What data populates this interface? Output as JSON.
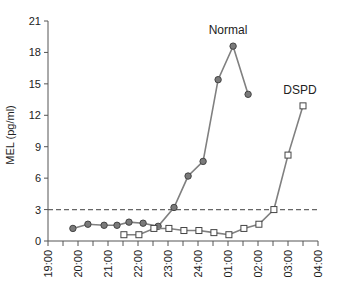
{
  "chart_data": {
    "type": "line",
    "title": "",
    "xlabel": "",
    "ylabel": "MEL (pg/ml)",
    "ylim": [
      0,
      21
    ],
    "yticks": [
      0,
      3,
      6,
      9,
      12,
      15,
      18,
      21
    ],
    "xlim_hours": [
      19,
      28
    ],
    "xticks": [
      "19:00",
      "20:00",
      "21:00",
      "22:00",
      "23:00",
      "24:00",
      "01:00",
      "02:00",
      "03:00",
      "04:00"
    ],
    "minor_tick_interval_minutes": 30,
    "grid": false,
    "reference_line": {
      "y": 3,
      "style": "dashed",
      "label": ""
    },
    "series": [
      {
        "name": "Normal",
        "marker": "circle-filled",
        "x": [
          "19:50",
          "20:20",
          "20:52",
          "21:18",
          "21:42",
          "22:10",
          "22:40",
          "23:12",
          "23:40",
          "24:10",
          "24:40",
          "01:10",
          "01:40"
        ],
        "x_hours": [
          19.83,
          20.33,
          20.87,
          21.3,
          21.7,
          22.17,
          22.67,
          23.2,
          23.67,
          24.17,
          24.67,
          25.17,
          25.67
        ],
        "values": [
          1.2,
          1.6,
          1.5,
          1.5,
          1.8,
          1.7,
          1.4,
          3.2,
          6.2,
          7.6,
          15.4,
          18.6,
          14.0
        ],
        "label_position": {
          "x_hours": 25.0,
          "y": 19.8
        }
      },
      {
        "name": "DSPD",
        "marker": "square-open",
        "x": [
          "21:32",
          "22:02",
          "22:32",
          "23:02",
          "23:32",
          "24:02",
          "24:32",
          "01:02",
          "01:32",
          "02:02",
          "02:32",
          "03:00",
          "03:30"
        ],
        "x_hours": [
          21.53,
          22.03,
          22.53,
          23.03,
          23.53,
          24.03,
          24.53,
          25.03,
          25.53,
          26.03,
          26.53,
          27.0,
          27.5
        ],
        "values": [
          0.6,
          0.6,
          1.2,
          1.2,
          1.0,
          1.0,
          0.8,
          0.6,
          1.2,
          1.6,
          3.0,
          8.2,
          12.9
        ],
        "label_position": {
          "x_hours": 27.4,
          "y": 14.0
        }
      }
    ]
  },
  "colors": {
    "axis": "#555555",
    "line": "#808080",
    "normal_marker_fill": "#7a7a7a",
    "normal_marker_stroke": "#444444",
    "dspd_marker_fill": "#ffffff",
    "dspd_marker_stroke": "#444444",
    "reference_line": "#666666",
    "text": "#222222"
  }
}
